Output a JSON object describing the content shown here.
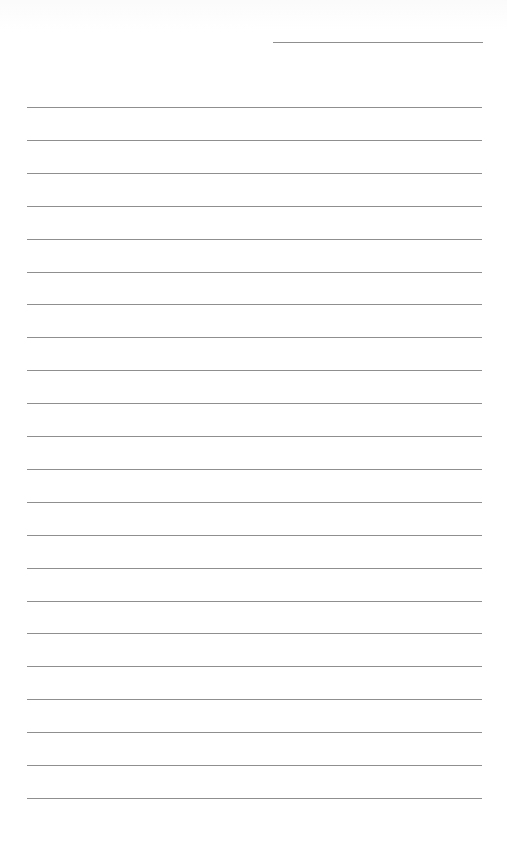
{
  "document": {
    "type": "lined-paper",
    "background_color": "#ffffff",
    "line_color": "#8f8f8f",
    "header_line": {
      "left": 273,
      "top": 42,
      "width": 210
    },
    "rules": {
      "count": 22,
      "left": 27,
      "width": 455,
      "first_top": 107,
      "spacing": 32.9
    },
    "text_content": []
  }
}
